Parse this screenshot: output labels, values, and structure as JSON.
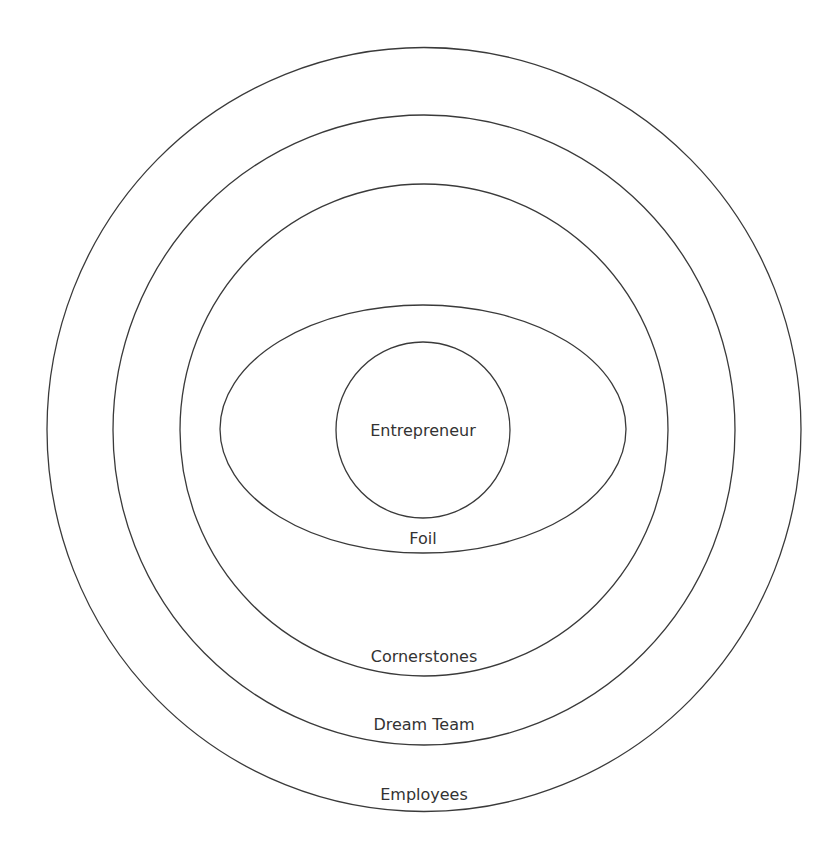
{
  "diagram": {
    "type": "nested-circles",
    "colors": {
      "stroke": "#3a3a3a",
      "text": "#333333",
      "background": "#ffffff"
    },
    "rings": [
      {
        "id": "employees",
        "label": "Employees",
        "cx": 424,
        "cy": 429.5,
        "rx": 377,
        "ry": 382,
        "label_y": 800
      },
      {
        "id": "dream-team",
        "label": "Dream Team",
        "cx": 424,
        "cy": 430,
        "rx": 311,
        "ry": 315,
        "label_y": 730
      },
      {
        "id": "cornerstones",
        "label": "Cornerstones",
        "cx": 424,
        "cy": 430,
        "rx": 244,
        "ry": 246,
        "label_y": 662
      },
      {
        "id": "foil",
        "label": "Foil",
        "cx": 423,
        "cy": 429,
        "rx": 203,
        "ry": 124,
        "label_y": 544
      },
      {
        "id": "entrepreneur",
        "label": "Entrepreneur",
        "cx": 423,
        "cy": 430,
        "rx": 87,
        "ry": 88,
        "label_y": 436
      }
    ]
  }
}
